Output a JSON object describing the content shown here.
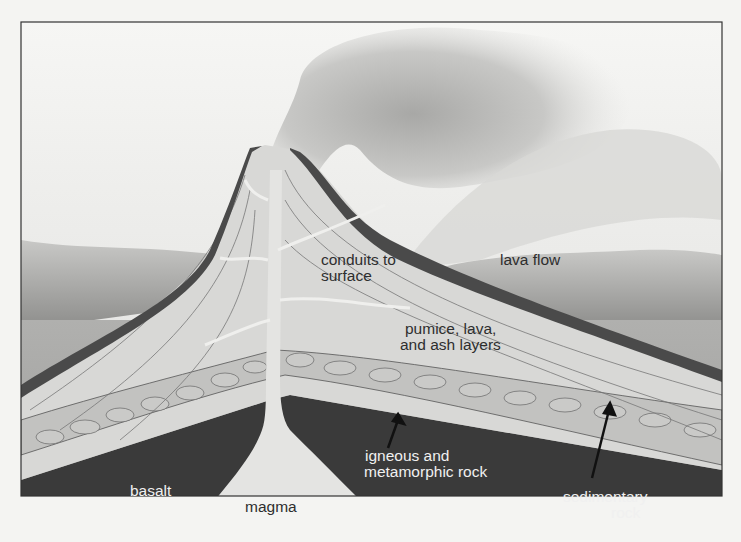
{
  "diagram": {
    "labels": {
      "conduits": [
        "conduits to",
        "surface"
      ],
      "lava_flow": "lava flow",
      "layers": [
        "pumice, lava,",
        "and ash layers"
      ],
      "igneous": [
        "igneous and",
        "metamorphic rock"
      ],
      "basalt": "basalt",
      "magma": "magma",
      "sedimentary": [
        "sedimentary",
        "rock"
      ]
    },
    "colors": {
      "background": "#f4f4f2",
      "sky": "#e9e9e7",
      "ground": "#a9a9a9",
      "cone": "#d6d6d4",
      "lava_crust": "#4a4a4a",
      "bedrock": "#3c3c3c",
      "magma": "#e2e2e0",
      "sediment": "#c4c4c2"
    }
  }
}
